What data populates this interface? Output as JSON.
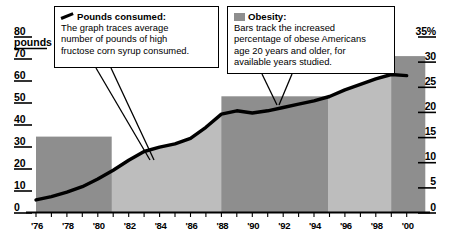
{
  "chart_data": {
    "type": "line",
    "title": "",
    "xlabel": "",
    "ylabel": "pounds",
    "x": [
      "'76",
      "'77",
      "'78",
      "'79",
      "'80",
      "'81",
      "'82",
      "'83",
      "'84",
      "'85",
      "'86",
      "'87",
      "'88",
      "'89",
      "'90",
      "'91",
      "'92",
      "'93",
      "'94",
      "'95",
      "'96",
      "'97",
      "'98",
      "'99",
      "'00"
    ],
    "xtick_labels": [
      "'76",
      "'78",
      "'80",
      "'82",
      "'84",
      "'86",
      "'88",
      "'90",
      "'92",
      "'94",
      "'96",
      "'98",
      "'00"
    ],
    "left_axis": {
      "label": "pounds",
      "unit_top": "80",
      "ticks": [
        "80",
        "70",
        "60",
        "50",
        "40",
        "30",
        "20",
        "10",
        "0"
      ],
      "ylim": [
        0,
        80
      ]
    },
    "right_axis": {
      "label": "35%",
      "ticks": [
        "35%",
        "30",
        "25",
        "20",
        "15",
        "10",
        "5",
        "0"
      ],
      "ylim": [
        0,
        35
      ]
    },
    "grid": false,
    "legend_position": "callouts",
    "series": [
      {
        "name": "Pounds consumed",
        "type": "line",
        "axis": "left",
        "values": [
          5.5,
          7,
          9,
          11.5,
          15,
          19,
          23.5,
          27.5,
          29.5,
          31,
          33.5,
          38.5,
          44.5,
          46,
          45,
          46,
          47.5,
          49,
          50.5,
          52.5,
          55.5,
          58,
          60.5,
          62.5,
          62
        ]
      },
      {
        "name": "Obesity",
        "type": "bar",
        "axis": "right",
        "bars": [
          {
            "label": "1976-1980",
            "start": "'76",
            "end": "'80",
            "value": 15
          },
          {
            "label": "1988-1994",
            "start": "'88",
            "end": "'94",
            "value": 23
          },
          {
            "label": "1999-2000",
            "start": "'99",
            "end": "'00",
            "value": 31
          }
        ]
      }
    ],
    "annotations": [
      {
        "id": "pounds-callout",
        "title": "Pounds consumed:",
        "icon": "line-swatch",
        "text_lines": [
          "The graph traces average",
          "number of pounds of high",
          "fructose corn syrup consumed."
        ]
      },
      {
        "id": "obesity-callout",
        "title": "Obesity:",
        "icon": "bar-swatch",
        "text_lines": [
          "Bars track the increased",
          "percentage of obese Americans",
          "age 20 years and older, for",
          "available years studied."
        ]
      }
    ],
    "colors": {
      "line": "#000000",
      "area_fill": "#bdbdbd",
      "bar_fill": "#8e8e8e",
      "background": "#ffffff",
      "axis": "#000000"
    }
  }
}
